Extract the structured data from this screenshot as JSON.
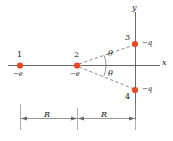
{
  "figure": {
    "type": "physics-charge-diagram",
    "background": "#ffffff",
    "charge_color": "#e8491f",
    "line_color": "#5a5a5a",
    "text_color": "#1a1a1a"
  },
  "axes": {
    "x_label": "x",
    "y_label": "y",
    "x_axis": {
      "x1": 8,
      "x2": 160,
      "y": 65
    },
    "y_axis": {
      "x": 135,
      "y1": 12,
      "y2": 120
    }
  },
  "charges": [
    {
      "id": "1",
      "number": "1",
      "charge": "−e",
      "cx": 20,
      "cy": 65,
      "num_pos": "above",
      "charge_pos": "below"
    },
    {
      "id": "2",
      "number": "2",
      "charge": "−e",
      "cx": 77,
      "cy": 65,
      "num_pos": "above",
      "charge_pos": "below"
    },
    {
      "id": "3",
      "number": "3",
      "charge": "−q",
      "cx": 135,
      "cy": 44,
      "num_pos": "above-left",
      "charge_pos": "right"
    },
    {
      "id": "4",
      "number": "4",
      "charge": "−q",
      "cx": 135,
      "cy": 90,
      "num_pos": "below-left",
      "charge_pos": "right"
    }
  ],
  "angles": [
    {
      "symbol": "θ",
      "x": 110,
      "y": 52,
      "at": "upper"
    },
    {
      "symbol": "θ",
      "x": 110,
      "y": 74,
      "at": "lower"
    }
  ],
  "dimensions": {
    "baseline_y": 118,
    "segments": [
      {
        "label": "R",
        "x1": 20,
        "x2": 77,
        "label_x": 45,
        "label_y": 113
      },
      {
        "label": "R",
        "x1": 77,
        "x2": 135,
        "label_x": 102,
        "label_y": 113
      }
    ]
  },
  "dashed_lines": [
    {
      "from": "2",
      "to": "3"
    },
    {
      "from": "2",
      "to": "4"
    }
  ]
}
